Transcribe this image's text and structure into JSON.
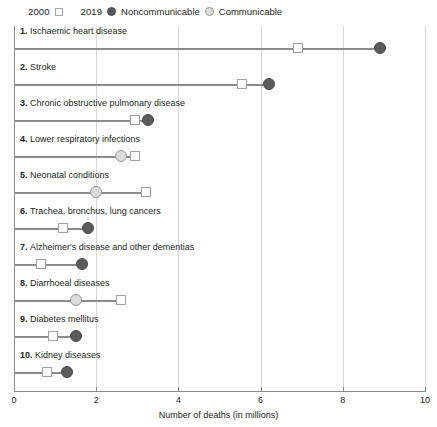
{
  "legend": {
    "year_2000": {
      "label": "2000",
      "marker": "hollow-square-icon"
    },
    "year_2019": {
      "label": "2019"
    },
    "categories": [
      {
        "label": "Noncommunicable",
        "marker": "filled-circle-icon",
        "color": "#595959"
      },
      {
        "label": "Communicable",
        "marker": "hollow-circle-icon",
        "color": "#dedede"
      }
    ]
  },
  "axis": {
    "xlabel": "Number of deaths (in millions)",
    "ticks": [
      "0",
      "2",
      "4",
      "6",
      "8",
      "10"
    ]
  },
  "chart_data": {
    "type": "scatter",
    "subtype": "dumbbell",
    "title": "",
    "xlabel": "Number of deaths (in millions)",
    "ylabel": "",
    "xlim": [
      0,
      10
    ],
    "xticks": [
      0,
      2,
      4,
      6,
      8,
      10
    ],
    "grid": true,
    "legend_position": "top-left",
    "series": [
      {
        "name": "2000",
        "marker": "hollow-square"
      },
      {
        "name": "2019",
        "marker": "circle"
      }
    ],
    "categories_legend": [
      "Noncommunicable",
      "Communicable"
    ],
    "rows": [
      {
        "rank": "1.",
        "label": "Ischaemic heart disease",
        "category": "Noncommunicable",
        "v2000": 6.9,
        "v2019": 8.9
      },
      {
        "rank": "2.",
        "label": "Stroke",
        "category": "Noncommunicable",
        "v2000": 5.55,
        "v2019": 6.2
      },
      {
        "rank": "3.",
        "label": "Chronic obstructive pulmonary disease",
        "category": "Noncommunicable",
        "v2000": 2.95,
        "v2019": 3.25
      },
      {
        "rank": "4.",
        "label": "Lower respiratory infections",
        "category": "Communicable",
        "v2000": 2.95,
        "v2019": 2.6
      },
      {
        "rank": "5.",
        "label": "Neonatal conditions",
        "category": "Communicable",
        "v2000": 3.2,
        "v2019": 2.0
      },
      {
        "rank": "6.",
        "label": "Trachea, bronchus, lung cancers",
        "category": "Noncommunicable",
        "v2000": 1.2,
        "v2019": 1.8
      },
      {
        "rank": "7.",
        "label": "Alzheimer's disease and other dementias",
        "category": "Noncommunicable",
        "v2000": 0.65,
        "v2019": 1.65
      },
      {
        "rank": "8.",
        "label": "Diarrhoeal diseases",
        "category": "Communicable",
        "v2000": 2.6,
        "v2019": 1.5
      },
      {
        "rank": "9.",
        "label": "Diabetes mellitus",
        "category": "Noncommunicable",
        "v2000": 0.95,
        "v2019": 1.5
      },
      {
        "rank": "10.",
        "label": "Kidney diseases",
        "category": "Noncommunicable",
        "v2000": 0.8,
        "v2019": 1.3
      }
    ]
  }
}
